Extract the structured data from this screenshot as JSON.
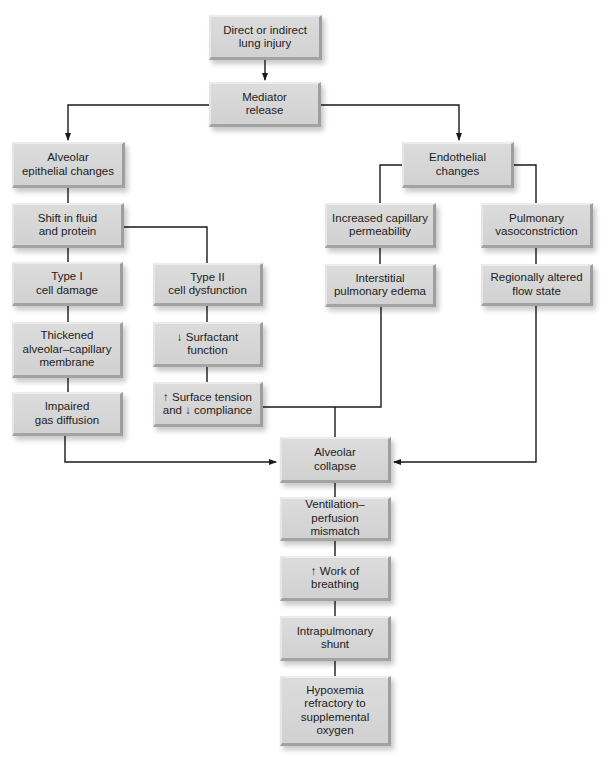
{
  "diagram": {
    "type": "flowchart",
    "topic": "Pathophysiology of acute lung injury / ARDS",
    "nodes": {
      "injury": {
        "label": "Direct or indirect\nlung injury"
      },
      "mediator": {
        "label": "Mediator\nrelease"
      },
      "epithelial": {
        "label": "Alveolar\nepithelial changes"
      },
      "endothelial": {
        "label": "Endothelial\nchanges"
      },
      "shift": {
        "label": "Shift in fluid\nand protein"
      },
      "cap_perm": {
        "label": "Increased capillary\npermeability"
      },
      "vasoconstriction": {
        "label": "Pulmonary\nvasoconstriction"
      },
      "type1": {
        "label": "Type I\ncell damage"
      },
      "type2": {
        "label": "Type II\ncell dysfunction"
      },
      "interstitial": {
        "label": "Interstitial\npulmonary edema"
      },
      "flow_state": {
        "label": "Regionally altered\nflow state"
      },
      "thickened": {
        "label": "Thickened\nalveolar–capillary\nmembrane"
      },
      "surfactant": {
        "label": "↓ Surfactant\nfunction"
      },
      "impaired": {
        "label": "Impaired\ngas diffusion"
      },
      "surface_tension": {
        "label": "↑ Surface tension\nand ↓ compliance"
      },
      "collapse": {
        "label": "Alveolar\ncollapse"
      },
      "vq": {
        "label": "Ventilation–\nperfusion mismatch"
      },
      "work": {
        "label": "↑ Work of\nbreathing"
      },
      "shunt": {
        "label": "Intrapulmonary\nshunt"
      },
      "hypoxemia": {
        "label": "Hypoxemia\nrefractory to\nsupplemental\noxygen"
      }
    },
    "edges": [
      [
        "injury",
        "mediator"
      ],
      [
        "mediator",
        "epithelial"
      ],
      [
        "mediator",
        "endothelial"
      ],
      [
        "epithelial",
        "shift"
      ],
      [
        "shift",
        "type1"
      ],
      [
        "shift",
        "type2"
      ],
      [
        "type1",
        "thickened"
      ],
      [
        "thickened",
        "impaired"
      ],
      [
        "type2",
        "surfactant"
      ],
      [
        "surfactant",
        "surface_tension"
      ],
      [
        "endothelial",
        "cap_perm"
      ],
      [
        "endothelial",
        "vasoconstriction"
      ],
      [
        "cap_perm",
        "interstitial"
      ],
      [
        "vasoconstriction",
        "flow_state"
      ],
      [
        "impaired",
        "collapse"
      ],
      [
        "surface_tension",
        "collapse"
      ],
      [
        "interstitial",
        "collapse"
      ],
      [
        "flow_state",
        "collapse"
      ],
      [
        "collapse",
        "vq"
      ],
      [
        "vq",
        "work"
      ],
      [
        "work",
        "shunt"
      ],
      [
        "shunt",
        "hypoxemia"
      ]
    ],
    "colors": {
      "box_fill": "#d4d4d4",
      "line": "#1a1a1a",
      "text": "#1c1c1c"
    }
  }
}
